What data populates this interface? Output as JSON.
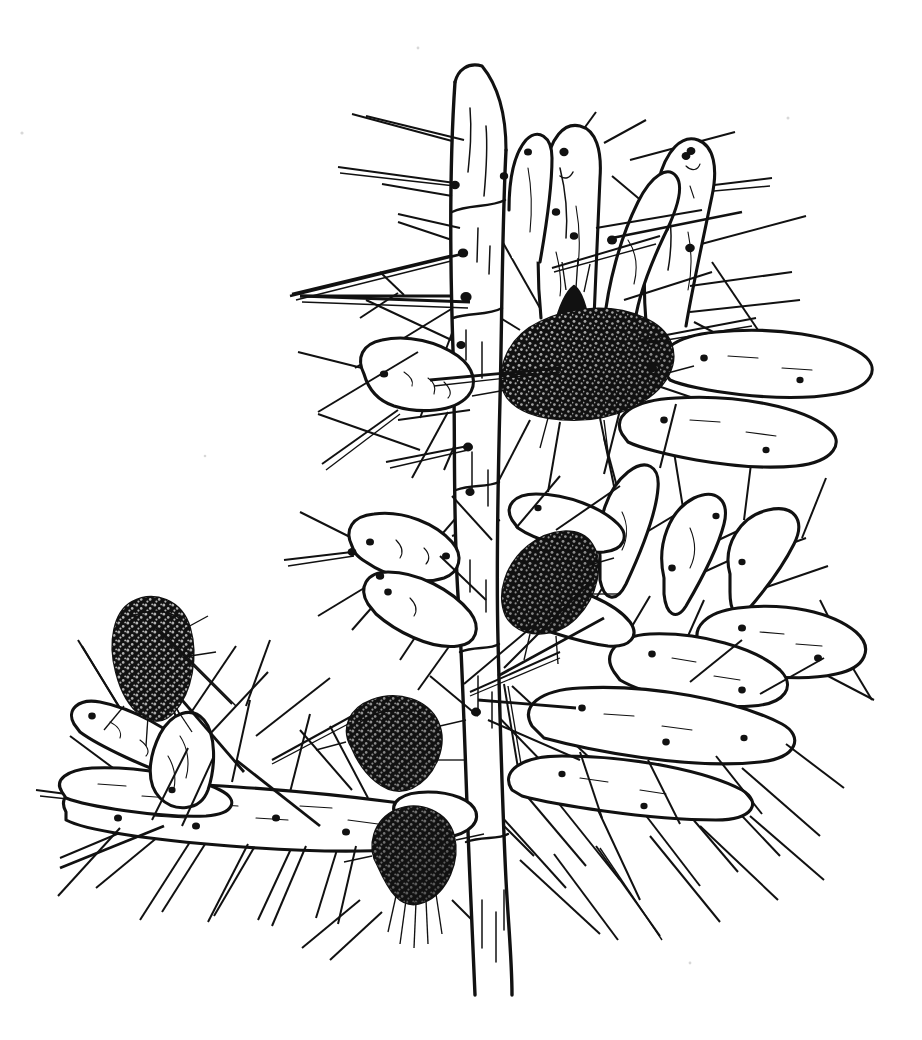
{
  "figure": {
    "medium": "pen-and-ink line drawing",
    "background_color": "#ffffff",
    "ink_color": "#111111",
    "canvas": {
      "width": 922,
      "height": 1040
    },
    "caption": "",
    "label": ""
  },
  "scene": {
    "description": "Branching cylindrical cactus with a vertical central trunk, clustered finger-like stem joints, long radiating spines and several dark stippled fruits.",
    "bounding_box": {
      "left": 45,
      "top": 55,
      "right": 880,
      "bottom": 995
    }
  },
  "parts": {
    "trunk": {
      "name": "central trunk",
      "top_y": 60,
      "bottom_y": 995,
      "x_center": 480
    },
    "branches": [
      {
        "name": "lower-left horizontal branch",
        "direction": "left"
      },
      {
        "name": "right stem cluster",
        "direction": "right"
      },
      {
        "name": "upper stem tips",
        "direction": "up"
      }
    ],
    "fruits": [
      {
        "name": "upper-center fruit",
        "cx": 585,
        "cy": 368,
        "rx": 82,
        "ry": 58,
        "rotation": -12,
        "shading": "solid black with white stipple"
      },
      {
        "name": "mid-right fruit",
        "cx": 548,
        "cy": 595,
        "rx": 48,
        "ry": 62,
        "rotation": -28,
        "shading": "solid black with white stipple"
      },
      {
        "name": "left fruit",
        "cx": 152,
        "cy": 668,
        "rx": 40,
        "ry": 58,
        "rotation": 6,
        "shading": "solid black with white stipple"
      },
      {
        "name": "lower-center upper fruit",
        "cx": 395,
        "cy": 750,
        "rx": 42,
        "ry": 48,
        "rotation": -20,
        "shading": "solid black with white stipple"
      },
      {
        "name": "lower-center lower fruit",
        "cx": 418,
        "cy": 868,
        "rx": 38,
        "ry": 45,
        "rotation": -6,
        "shading": "solid black with white stipple"
      }
    ],
    "features": [
      {
        "name": "areole",
        "description": "small solid black dot on stem surface from which spines emerge"
      },
      {
        "name": "spine",
        "description": "long straight tapering needle radiating outward"
      },
      {
        "name": "stem-joint",
        "description": "cylindrical club-shaped segment"
      }
    ]
  },
  "counts": {
    "fruits": 5,
    "visible_stem_joints": 24,
    "approx_spines": 120
  }
}
